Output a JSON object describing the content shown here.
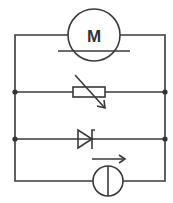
{
  "diagram": {
    "type": "circuit-schematic",
    "components": [
      {
        "id": "motor",
        "symbol": "motor",
        "label": "M"
      },
      {
        "id": "variable-resistor",
        "symbol": "variable-resistor"
      },
      {
        "id": "zener-diode",
        "symbol": "zener-diode"
      },
      {
        "id": "current-source",
        "symbol": "current-source-with-arrow"
      }
    ],
    "colors": {
      "line": "#3a3a3a",
      "background": "#ffffff"
    }
  }
}
